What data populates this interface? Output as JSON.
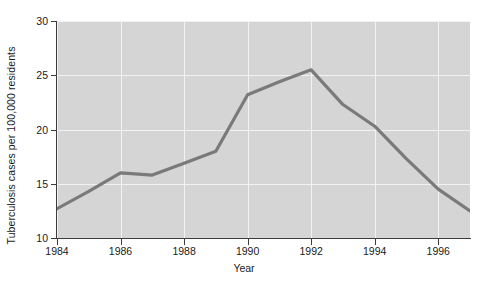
{
  "chart_data": {
    "type": "line",
    "title": "",
    "xlabel": "Year",
    "ylabel": "Tuberculosis cases per 100,000 residents",
    "xlim": [
      1984,
      1997
    ],
    "ylim": [
      10,
      30
    ],
    "xticks": [
      1984,
      1986,
      1988,
      1990,
      1992,
      1994,
      1996
    ],
    "xticklabels": [
      "1984",
      "1986",
      "1988",
      "1990",
      "1992",
      "1994",
      "1996"
    ],
    "yticks": [
      10,
      15,
      20,
      25,
      30
    ],
    "yticklabels": [
      "10",
      "15",
      "20",
      "25",
      "30"
    ],
    "grid": true,
    "grid_color": "#f2f2f2",
    "plot_background": "#d5d5d5",
    "page_background": "#ffffff",
    "line_color": "#7a7a7a",
    "line_width": 3.2,
    "legend": null,
    "x": [
      1984,
      1985,
      1986,
      1987,
      1988,
      1989,
      1990,
      1991,
      1992,
      1993,
      1994,
      1995,
      1996,
      1997
    ],
    "values": [
      12.7,
      14.3,
      16.0,
      15.8,
      16.9,
      18.0,
      23.2,
      24.4,
      25.5,
      22.3,
      20.3,
      17.3,
      14.5,
      12.5
    ],
    "series": [
      {
        "name": "Tuberculosis cases per 100,000 residents",
        "values": [
          12.7,
          14.3,
          16.0,
          15.8,
          16.9,
          18.0,
          23.2,
          24.4,
          25.5,
          22.3,
          20.3,
          17.3,
          14.5,
          12.5
        ]
      }
    ]
  }
}
